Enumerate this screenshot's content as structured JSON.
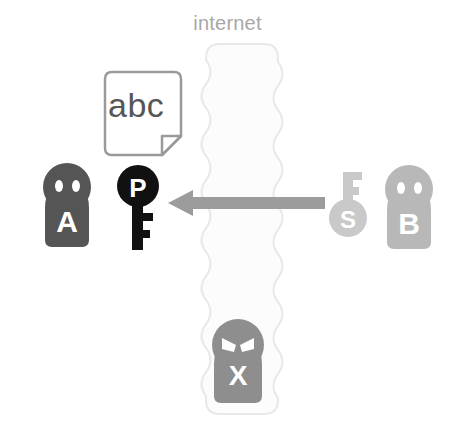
{
  "diagram": {
    "title_label": "internet",
    "channel": {
      "name": "internet-channel",
      "fill": "#fcfcfc",
      "stroke": "#e8e8e8"
    },
    "actors": [
      {
        "id": "alice",
        "label": "A",
        "icon": "person-icon",
        "color": "#555555",
        "eye_color": "#ffffff",
        "position": "left-outside-channel"
      },
      {
        "id": "bob",
        "label": "B",
        "icon": "person-icon",
        "color": "#b8b8b8",
        "eye_color": "#ffffff",
        "position": "right-outside-channel"
      },
      {
        "id": "attacker",
        "label": "X",
        "icon": "person-villain-icon",
        "color": "#8e8e8e",
        "eye_color": "#ffffff",
        "position": "inside-channel-bottom"
      }
    ],
    "keys": [
      {
        "id": "public-key",
        "label": "P",
        "icon": "key-icon",
        "color": "#111111",
        "letter_color": "#ffffff",
        "orientation": "head-up"
      },
      {
        "id": "secret-key",
        "label": "S",
        "icon": "key-icon",
        "color": "#c9c9c9",
        "letter_color": "#ffffff",
        "orientation": "head-down"
      }
    ],
    "document": {
      "id": "plaintext-document",
      "label": "abc",
      "icon": "document-icon",
      "fill": "#ffffff",
      "stroke": "#9a9a9a",
      "text_color": "#565656"
    },
    "arrow": {
      "id": "transmission-arrow",
      "icon": "arrow-left-icon",
      "color": "#9c9c9c",
      "direction": "right-to-left"
    },
    "colors": {
      "background": "#ffffff",
      "label_gray": "#a8a8a8",
      "dark_gray": "#555555",
      "mid_gray": "#8e8e8e",
      "light_gray": "#b8b8b8"
    }
  }
}
